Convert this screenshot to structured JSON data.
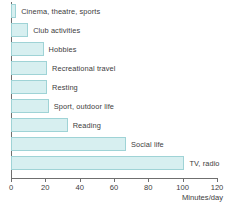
{
  "chart_data": {
    "type": "bar",
    "orientation": "horizontal",
    "title": "",
    "xlabel": "Minutes/day",
    "ylabel": "",
    "xlim": [
      0,
      120
    ],
    "xticks": [
      0,
      20,
      40,
      60,
      80,
      100,
      120
    ],
    "grid": false,
    "legend": false,
    "categories": [
      "Cinema, theatre, sports",
      "Club activities",
      "Hobbies",
      "Recreational travel",
      "Resting",
      "Sport, outdoor life",
      "Reading",
      "Social life",
      "TV, radio"
    ],
    "values": [
      3,
      10,
      19,
      21,
      21,
      22,
      33,
      67,
      101
    ],
    "bar_fill_color": "#d7eff0",
    "bar_border_color": "#9fd3d6",
    "axis_color": "#6f6f6f",
    "text_color": "#3c3c3c"
  }
}
